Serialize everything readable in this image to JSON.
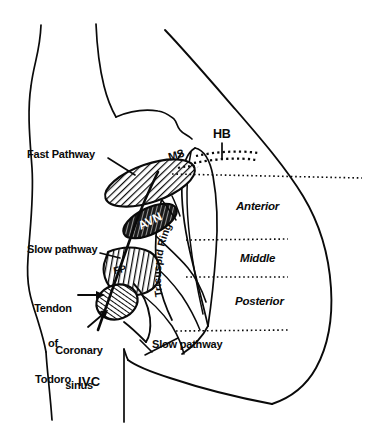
{
  "figure": {
    "background_color": "#ffffff",
    "ink_color": "#0a0a0a"
  },
  "labels": {
    "fast_pathway": "Fast Pathway",
    "slow_pathway_left": "Slow pathway",
    "slow_pathway_bottom": "Slow pathway",
    "tendon_of_todoro": "Tendon\nof\nTodoro",
    "tendon_line1": "Tendon",
    "tendon_line2": "of",
    "tendon_line3": "Todoro",
    "coronary_sinus": "Coronary\nsinus",
    "coronary_line1": "Coronary",
    "coronary_line2": "sinus",
    "ivc": "IVC",
    "his_bundle": "HB",
    "membranous_septum": "MS",
    "av_node": "AVN",
    "fp_marker": "FP",
    "tricuspid_ring": "Tricuspid Ring",
    "tricuspid_word1": "Tricuspid",
    "tricuspid_word2": "Ring",
    "region_anterior": "Anterior",
    "region_middle": "Middle",
    "region_posterior": "Posterior"
  },
  "regions": [
    {
      "name": "anterior",
      "label": "Anterior"
    },
    {
      "name": "middle",
      "label": "Middle"
    },
    {
      "name": "posterior",
      "label": "Posterior"
    }
  ],
  "icons": {
    "arrow_tendon": "arrow-right-icon",
    "arrow_coronary": "arrow-up-right-icon",
    "leader_fast": "leader-line-icon",
    "leader_slow": "leader-line-icon",
    "leader_hb": "leader-line-icon",
    "leader_slow_bottom": "leader-line-icon"
  },
  "divider_lines": [
    {
      "name": "his-band-divider",
      "y": 173
    },
    {
      "name": "anterior-middle-divider",
      "y": 240
    },
    {
      "name": "middle-posterior-divider",
      "y": 277
    },
    {
      "name": "posterior-lower-divider",
      "y": 330
    }
  ]
}
